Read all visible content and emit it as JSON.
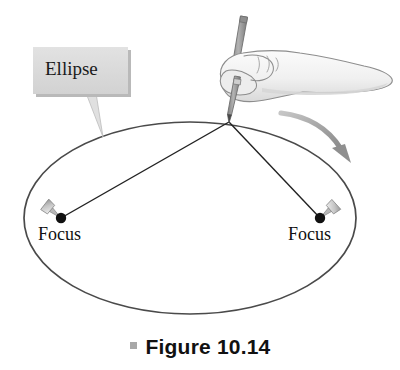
{
  "figure": {
    "caption": "Figure 10.14",
    "caption_bullet": "square-bullet",
    "background_color": "#ffffff"
  },
  "callout": {
    "label": "Ellipse",
    "box_fill": "#dcdcdc",
    "box_shadow": "#b4b4b4",
    "leader": "tapered-leader-line"
  },
  "diagram": {
    "type": "ellipse-construction",
    "ellipse": {
      "name": "ellipse-curve",
      "center_x": 190,
      "center_y": 218,
      "radius_x": 166,
      "radius_y": 96,
      "stroke": "#4a4a4a",
      "stroke_width": 1.6,
      "fill": "none"
    },
    "foci": [
      {
        "name": "focus-left",
        "label": "Focus",
        "x": 61,
        "y": 218,
        "dot_color": "#111111",
        "dot_radius": 5.2,
        "tack_angle_deg": -140
      },
      {
        "name": "focus-right",
        "label": "Focus",
        "x": 320,
        "y": 218,
        "dot_color": "#111111",
        "dot_radius": 5.2,
        "tack_angle_deg": -40
      }
    ],
    "pencil_point": {
      "x": 229,
      "y": 122
    },
    "strings": [
      {
        "name": "string-to-left-focus",
        "from_x": 229,
        "from_y": 122,
        "to_x": 61,
        "to_y": 218
      },
      {
        "name": "string-to-right-focus",
        "from_x": 229,
        "from_y": 122,
        "to_x": 320,
        "to_y": 218
      }
    ],
    "string_stroke": "#222222",
    "motion_arrow": {
      "name": "motion-arrow",
      "color": "#9a9a9a",
      "direction": "clockwise-down-right"
    },
    "hand": {
      "name": "hand-holding-pencil",
      "outline_color": "#8d8d8d",
      "fill_color": "#f3f3f3",
      "shade_color": "#d8d8d8"
    },
    "pencil": {
      "name": "pencil",
      "body_color": "#9c9c9c",
      "outline_color": "#6e6e6e"
    }
  }
}
